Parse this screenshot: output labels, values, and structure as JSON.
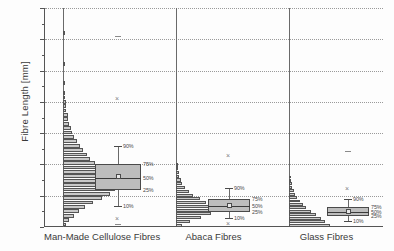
{
  "chart_data": {
    "type": "box",
    "title": "",
    "xlabel": "",
    "ylabel": "Fibre Length [mm]",
    "ylim": [
      0.0,
      3.5
    ],
    "ytick_values": [
      0.0,
      0.5,
      1.0,
      1.5,
      2.0,
      2.5,
      3.0,
      3.5
    ],
    "ytick_labels": [
      "0,0",
      "0,5",
      "1,0",
      "1,5",
      "2,0",
      "2,5",
      "3,0",
      "3,5"
    ],
    "grid": true,
    "legend": "none",
    "decimal_separator": "comma",
    "percentile_labels": [
      "90%",
      "75%",
      "50%",
      "25%",
      "10%"
    ],
    "categories": [
      "Man-Made Cellulose Fibres",
      "Abaca Fibres",
      "Glass Fibres"
    ],
    "series": [
      {
        "name": "Man-Made Cellulose Fibres",
        "p10": 0.33,
        "p25": 0.59,
        "p50": 0.78,
        "p75": 1.01,
        "p90": 1.29,
        "mean": 0.8,
        "outliers_x": [
          2.05,
          0.12
        ],
        "outliers_dash": [
          3.05,
          0.05
        ],
        "histogram": {
          "bin_width": 0.07,
          "bins": [
            {
              "center": 0.04,
              "count": 2
            },
            {
              "center": 0.11,
              "count": 4
            },
            {
              "center": 0.18,
              "count": 7
            },
            {
              "center": 0.25,
              "count": 10
            },
            {
              "center": 0.32,
              "count": 14
            },
            {
              "center": 0.39,
              "count": 19
            },
            {
              "center": 0.46,
              "count": 25
            },
            {
              "center": 0.53,
              "count": 30
            },
            {
              "center": 0.6,
              "count": 33
            },
            {
              "center": 0.67,
              "count": 31
            },
            {
              "center": 0.74,
              "count": 30
            },
            {
              "center": 0.81,
              "count": 27
            },
            {
              "center": 0.88,
              "count": 25
            },
            {
              "center": 0.95,
              "count": 23
            },
            {
              "center": 1.02,
              "count": 20
            },
            {
              "center": 1.09,
              "count": 17
            },
            {
              "center": 1.16,
              "count": 15
            },
            {
              "center": 1.23,
              "count": 13
            },
            {
              "center": 1.3,
              "count": 11
            },
            {
              "center": 1.37,
              "count": 9
            },
            {
              "center": 1.44,
              "count": 7
            },
            {
              "center": 1.51,
              "count": 6
            },
            {
              "center": 1.58,
              "count": 5
            },
            {
              "center": 1.65,
              "count": 4
            },
            {
              "center": 1.72,
              "count": 3
            },
            {
              "center": 1.79,
              "count": 3
            },
            {
              "center": 1.86,
              "count": 2
            },
            {
              "center": 1.93,
              "count": 2
            },
            {
              "center": 2.0,
              "count": 2
            },
            {
              "center": 2.07,
              "count": 1
            },
            {
              "center": 2.14,
              "count": 1
            },
            {
              "center": 2.3,
              "count": 1
            },
            {
              "center": 2.6,
              "count": 1
            },
            {
              "center": 3.1,
              "count": 1
            }
          ]
        }
      },
      {
        "name": "Abaca Fibres",
        "p10": 0.14,
        "p25": 0.24,
        "p50": 0.33,
        "p75": 0.45,
        "p90": 0.62,
        "mean": 0.35,
        "outliers_x": [
          1.13,
          0.04
        ],
        "outliers_dash": [],
        "histogram": {
          "bin_width": 0.06,
          "bins": [
            {
              "center": 0.03,
              "count": 4
            },
            {
              "center": 0.09,
              "count": 9
            },
            {
              "center": 0.15,
              "count": 16
            },
            {
              "center": 0.21,
              "count": 22
            },
            {
              "center": 0.27,
              "count": 25
            },
            {
              "center": 0.33,
              "count": 23
            },
            {
              "center": 0.39,
              "count": 19
            },
            {
              "center": 0.45,
              "count": 15
            },
            {
              "center": 0.51,
              "count": 11
            },
            {
              "center": 0.57,
              "count": 8
            },
            {
              "center": 0.63,
              "count": 6
            },
            {
              "center": 0.69,
              "count": 4
            },
            {
              "center": 0.75,
              "count": 3
            },
            {
              "center": 0.81,
              "count": 2
            },
            {
              "center": 0.87,
              "count": 2
            },
            {
              "center": 0.93,
              "count": 1
            },
            {
              "center": 0.99,
              "count": 1
            }
          ]
        }
      },
      {
        "name": "Glass Fibres",
        "p10": 0.1,
        "p25": 0.17,
        "p50": 0.24,
        "p75": 0.32,
        "p90": 0.44,
        "mean": 0.25,
        "outliers_x": [
          0.6
        ],
        "outliers_dash": [
          1.22
        ],
        "histogram": {
          "bin_width": 0.055,
          "bins": [
            {
              "center": 0.03,
              "count": 26
            },
            {
              "center": 0.085,
              "count": 23
            },
            {
              "center": 0.14,
              "count": 20
            },
            {
              "center": 0.195,
              "count": 17
            },
            {
              "center": 0.25,
              "count": 14
            },
            {
              "center": 0.305,
              "count": 11
            },
            {
              "center": 0.36,
              "count": 9
            },
            {
              "center": 0.415,
              "count": 7
            },
            {
              "center": 0.47,
              "count": 5
            },
            {
              "center": 0.525,
              "count": 4
            },
            {
              "center": 0.58,
              "count": 3
            },
            {
              "center": 0.635,
              "count": 2
            },
            {
              "center": 0.69,
              "count": 2
            },
            {
              "center": 0.745,
              "count": 1
            },
            {
              "center": 0.8,
              "count": 1
            }
          ]
        }
      }
    ]
  }
}
